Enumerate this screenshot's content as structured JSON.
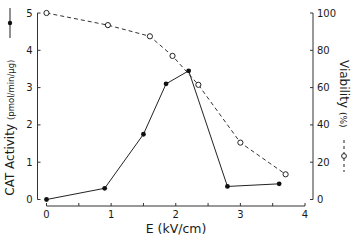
{
  "chart_data": {
    "type": "line",
    "title": "",
    "xlabel": "E (kV/cm)",
    "ylabel": "CAT Activity (pmol/min/μg)",
    "y2label": "Viability (%)",
    "xlim": [
      0,
      4
    ],
    "ylim": [
      0,
      5
    ],
    "y2lim": [
      0,
      100
    ],
    "xticks": [
      0,
      1,
      2,
      3,
      4
    ],
    "yticks": [
      0,
      1,
      2,
      3,
      4,
      5
    ],
    "y2ticks": [
      0,
      20,
      40,
      60,
      80,
      100
    ],
    "grid": false,
    "legend": "markers shown beside axis labels",
    "series": [
      {
        "name": "CAT Activity",
        "axis": "left",
        "style": "solid line, filled circles",
        "x": [
          0,
          0.9,
          1.5,
          1.85,
          2.2,
          2.8,
          3.6
        ],
        "values": [
          0.0,
          0.3,
          1.75,
          3.1,
          3.45,
          0.35,
          0.42
        ]
      },
      {
        "name": "Viability",
        "axis": "right",
        "style": "dashed line, open circles",
        "x": [
          0,
          0.95,
          1.6,
          1.95,
          2.35,
          3.0,
          3.7
        ],
        "values": [
          100,
          93.5,
          87.5,
          77,
          61.5,
          30.5,
          13.5
        ]
      }
    ]
  },
  "labels": {
    "ylabel_main": "CAT Activity",
    "ylabel_units": "(pmol/min/μg)",
    "y2label_main": "Viability",
    "y2label_units": "(%)",
    "xlabel": "E (kV/cm)"
  }
}
